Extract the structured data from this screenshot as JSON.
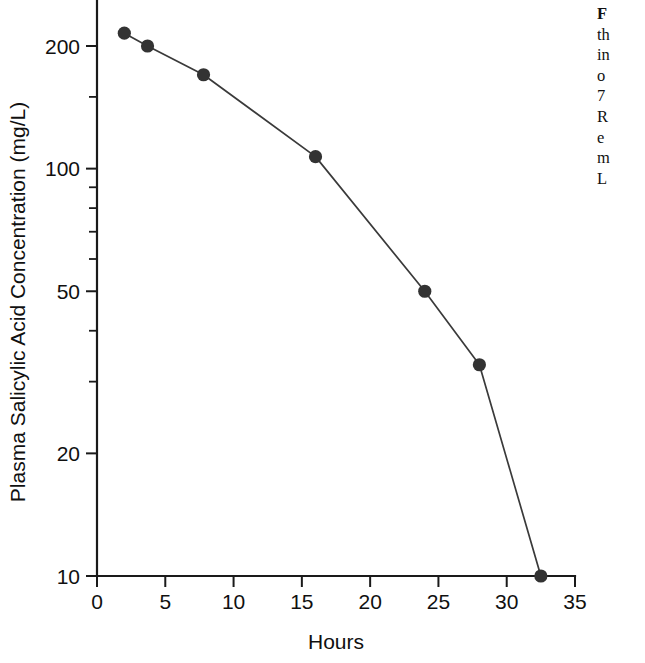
{
  "chart_data": {
    "type": "line",
    "title": "",
    "xlabel": "Hours",
    "ylabel": "Plasma Salicylic Acid Concentration (mg/L)",
    "xlim": [
      0,
      35
    ],
    "ylim": [
      10,
      260
    ],
    "yscale": "log",
    "xscale": "linear",
    "grid": false,
    "legend": false,
    "marker": "filled-circle",
    "series": [
      {
        "name": "Plasma salicylic acid",
        "x": [
          2.0,
          3.7,
          7.8,
          16.0,
          24.0,
          28.0,
          32.5
        ],
        "y": [
          215,
          200,
          170,
          107,
          50,
          33,
          10
        ]
      }
    ],
    "x_ticks": [
      0,
      5,
      10,
      15,
      20,
      25,
      30,
      35
    ],
    "x_tick_labels": [
      "0",
      "5",
      "10",
      "15",
      "20",
      "25",
      "30",
      "35"
    ],
    "y_ticks_major": [
      10,
      20,
      50,
      100,
      200
    ],
    "y_tick_labels": [
      "10",
      "20",
      "50",
      "100",
      "200"
    ],
    "y_ticks_minor": [
      30,
      40,
      60,
      70,
      80,
      90,
      150
    ],
    "colors": {
      "axis": "#1a1a1a",
      "line": "#3a3a3a",
      "marker": "#333333",
      "text": "#101010",
      "background": "#ffffff"
    }
  },
  "caption": {
    "lines": [
      "F",
      "th",
      "in",
      "o",
      "7",
      "R",
      "e",
      "m",
      "L"
    ]
  }
}
